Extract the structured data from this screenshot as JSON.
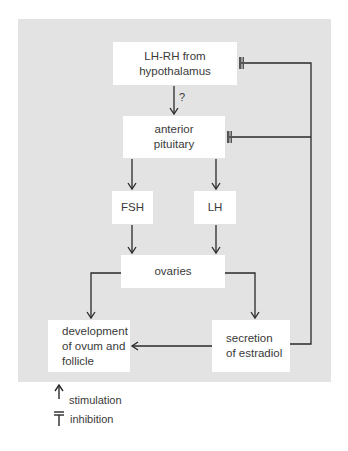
{
  "diagram": {
    "nodes": {
      "lhrh": "LH-RH from\nhypothalamus",
      "pituitary": "anterior\npituitary",
      "fsh": "FSH",
      "lh": "LH",
      "ovaries": "ovaries",
      "development": "development\nof ovum and\nfollicle",
      "estradiol": "secretion\nof estradiol"
    },
    "edge_labels": {
      "lhrh_to_pituitary": "?"
    },
    "edges": [
      {
        "from": "lhrh",
        "to": "pituitary",
        "type": "stimulation",
        "label": "?"
      },
      {
        "from": "pituitary",
        "to": "fsh",
        "type": "stimulation"
      },
      {
        "from": "pituitary",
        "to": "lh",
        "type": "stimulation"
      },
      {
        "from": "fsh",
        "to": "ovaries",
        "type": "stimulation"
      },
      {
        "from": "lh",
        "to": "ovaries",
        "type": "stimulation"
      },
      {
        "from": "ovaries",
        "to": "development",
        "type": "stimulation"
      },
      {
        "from": "ovaries",
        "to": "estradiol",
        "type": "stimulation"
      },
      {
        "from": "estradiol",
        "to": "development",
        "type": "stimulation"
      },
      {
        "from": "estradiol",
        "to": "lhrh",
        "type": "inhibition"
      },
      {
        "from": "estradiol",
        "to": "pituitary",
        "type": "inhibition"
      }
    ],
    "legend": {
      "stimulation": "stimulation",
      "inhibition": "inhibition"
    },
    "colors": {
      "panel": "#e3e3e3",
      "box": "#ffffff",
      "line": "#2a2a2a",
      "text": "#3a3a3a"
    }
  }
}
